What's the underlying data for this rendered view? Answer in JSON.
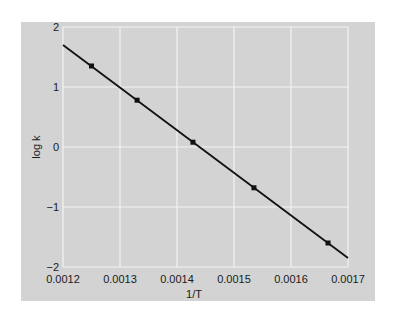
{
  "chart_data": {
    "type": "scatter",
    "title": "",
    "xlabel": "1/T",
    "ylabel": "log k",
    "xlim": [
      0.0012,
      0.0017
    ],
    "ylim": [
      -2,
      2
    ],
    "grid": true,
    "x_ticks": [
      "0.0012",
      "0.0013",
      "0.0014",
      "0.0015",
      "0.0016",
      "0.0017"
    ],
    "y_ticks": [
      "2",
      "1",
      "0",
      "−1",
      "−2"
    ],
    "series": [
      {
        "name": "data points",
        "marker": "square",
        "points": [
          {
            "x": 0.00125,
            "y": 1.35
          },
          {
            "x": 0.00133,
            "y": 0.78
          },
          {
            "x": 0.001428,
            "y": 0.08
          },
          {
            "x": 0.001535,
            "y": -0.68
          },
          {
            "x": 0.001665,
            "y": -1.6
          }
        ]
      },
      {
        "name": "fit line",
        "type": "line",
        "points": [
          {
            "x": 0.0012,
            "y": 1.7
          },
          {
            "x": 0.0017,
            "y": -1.85
          }
        ]
      }
    ],
    "legend": null
  },
  "colors": {
    "panel_bg": "#d3d3d3",
    "grid": "#f4f4f4",
    "line": "#111111",
    "text": "#1a1a1a"
  }
}
